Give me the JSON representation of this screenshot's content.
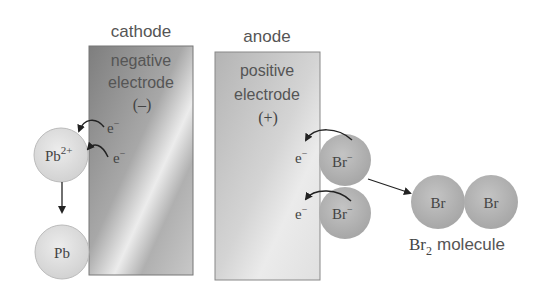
{
  "diagram": {
    "type": "electrolysis of molten lead(II) bromide",
    "cathode": {
      "title": "cathode",
      "line1": "negative",
      "line2": "electrode",
      "sign": "(–)"
    },
    "anode": {
      "title": "anode",
      "line1": "positive",
      "line2": "electrode",
      "sign": "(+)"
    },
    "lead_ion": {
      "symbol": "Pb",
      "charge": "2+"
    },
    "lead_atom": {
      "symbol": "Pb"
    },
    "electron": {
      "symbol": "e",
      "charge": "−"
    },
    "bromide_ion": {
      "symbol": "Br",
      "charge": "−"
    },
    "bromine_atom": {
      "symbol": "Br"
    },
    "molecule_label": {
      "symbol": "Br",
      "subscript": "2",
      "word": "molecule"
    },
    "colors": {
      "cathode_dark": "#8a8a8a",
      "cathode_light": "#e6e6e6",
      "anode_fill": "#c8c8c8",
      "lead_circle": "#e2e2e2",
      "bromine_circle": "#b4b4b4",
      "text": "#555555",
      "arrow": "#222222"
    }
  }
}
